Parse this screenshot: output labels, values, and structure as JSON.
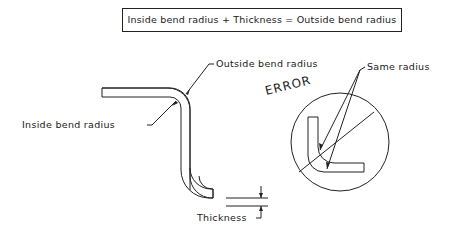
{
  "formula": {
    "text": "Inside bend radius + Thickness = Outside bend radius"
  },
  "labels": {
    "outside_bend_radius": "Outside bend radius",
    "inside_bend_radius": "Inside bend radius",
    "thickness": "Thickness",
    "same_radius": "Same radius",
    "error": "ERROR"
  },
  "colors": {
    "line": "#222222",
    "background": "#ffffff"
  }
}
